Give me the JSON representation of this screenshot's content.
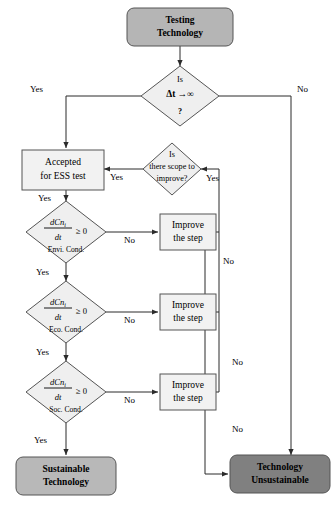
{
  "diagram": {
    "type": "flowchart",
    "colors": {
      "terminal_start_fill": "#b5b5b5",
      "terminal_sustainable_fill": "#b8b8b8",
      "terminal_unsustainable_fill": "#808080",
      "process_fill": "#f2f2f2",
      "decision_fill": "#efefef",
      "stroke": "#555555",
      "line": "#2b2b2b",
      "text": "#000000"
    },
    "nodes": {
      "start": {
        "label_line1": "Testing",
        "label_line2": "Technology",
        "shape": "rounded-rectangle"
      },
      "decision_time": {
        "line1": "Is",
        "line2_prefix": "Δt",
        "line2_arrow": "→∞",
        "line3": "?",
        "shape": "diamond"
      },
      "accepted": {
        "label_line1": "Accepted",
        "label_line2": "for ESS test",
        "shape": "rectangle"
      },
      "scope": {
        "line1": "Is",
        "line2": "there scope to",
        "line3": "improve?",
        "shape": "diamond"
      },
      "cond_envi": {
        "numerator": "dCn",
        "numerator_sub": "i",
        "denominator": "dt",
        "operator": "≥ 0",
        "caption": "Envi. Cond.",
        "shape": "diamond"
      },
      "cond_eco": {
        "numerator": "dCn",
        "numerator_sub": "i",
        "denominator": "dt",
        "operator": "≥ 0",
        "caption": "Eco. Cond.",
        "shape": "diamond"
      },
      "cond_soc": {
        "numerator": "dCn",
        "numerator_sub": "i",
        "denominator": "dt",
        "operator": "≥ 0",
        "caption": "Soc. Cond.",
        "shape": "diamond"
      },
      "improve_1": {
        "label_line1": "Improve",
        "label_line2": "the step",
        "shape": "rectangle"
      },
      "improve_2": {
        "label_line1": "Improve",
        "label_line2": "the step",
        "shape": "rectangle"
      },
      "improve_3": {
        "label_line1": "Improve",
        "label_line2": "the step",
        "shape": "rectangle"
      },
      "sustainable": {
        "label_line1": "Sustainable",
        "label_line2": "Technology",
        "shape": "rounded-rectangle"
      },
      "unsustainable": {
        "label_line1": "Technology",
        "label_line2": "Unsustainable",
        "shape": "rounded-rectangle"
      }
    },
    "edge_labels": {
      "time_yes": "Yes",
      "time_no": "No",
      "scope_yes_left": "Yes",
      "scope_yes_right": "Yes",
      "accepted_yes": "Yes",
      "envi_yes": "Yes",
      "envi_no": "No",
      "eco_yes": "Yes",
      "eco_no": "No",
      "soc_yes": "Yes",
      "soc_no": "No",
      "merge_no_1": "No",
      "merge_no_2": "No",
      "merge_no_3": "No"
    }
  }
}
